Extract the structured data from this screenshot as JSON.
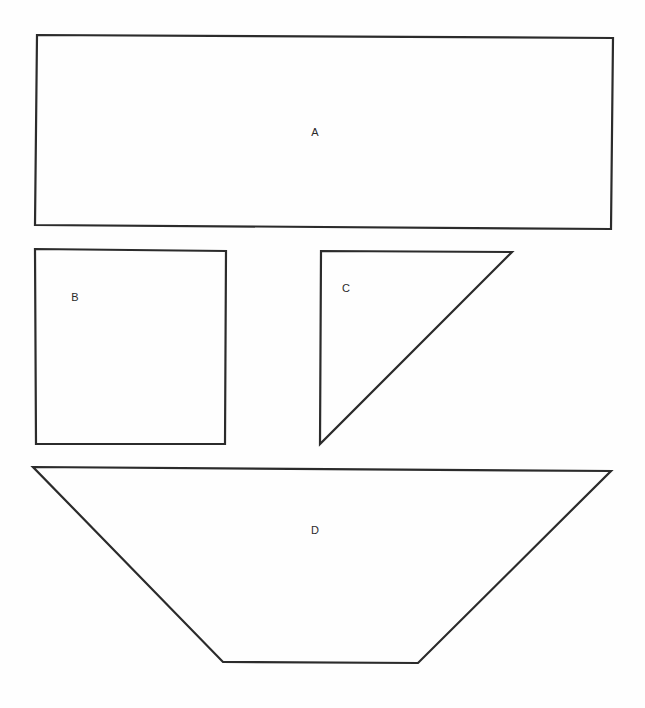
{
  "diagram": {
    "shapes": [
      {
        "id": "A",
        "label": "A",
        "type": "rectangle",
        "points": "37,35 613,38 611,229 35,225",
        "label_pos": {
          "x": 315,
          "y": 133
        }
      },
      {
        "id": "B",
        "label": "B",
        "type": "square",
        "points": "35,249 226,251 225,444 36,444",
        "label_pos": {
          "x": 75,
          "y": 298
        }
      },
      {
        "id": "C",
        "label": "C",
        "type": "right-triangle",
        "points": "321,251 512,252 320,444",
        "label_pos": {
          "x": 346,
          "y": 289
        }
      },
      {
        "id": "D",
        "label": "D",
        "type": "trapezoid",
        "points": "33,467 611,471 418,663 223,662",
        "label_pos": {
          "x": 315,
          "y": 531
        }
      }
    ]
  }
}
